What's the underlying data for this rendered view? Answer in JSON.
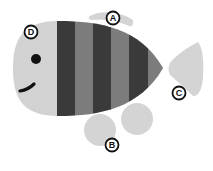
{
  "diagram": {
    "colors": {
      "body_light": "#d2d2d2",
      "stripe_dark": "#3a3a3a",
      "stripe_mid": "#7c7c7c",
      "fin": "#d4d4d4",
      "eye": "#111111",
      "label_ring": "#111111",
      "label_fill": "#ffffff"
    },
    "labels": [
      {
        "id": "A",
        "text": "A",
        "points_to": "dorsal fin"
      },
      {
        "id": "B",
        "text": "B",
        "points_to": "pelvic fins"
      },
      {
        "id": "C",
        "text": "C",
        "points_to": "tail fin"
      },
      {
        "id": "D",
        "text": "D",
        "points_to": "head"
      }
    ]
  }
}
